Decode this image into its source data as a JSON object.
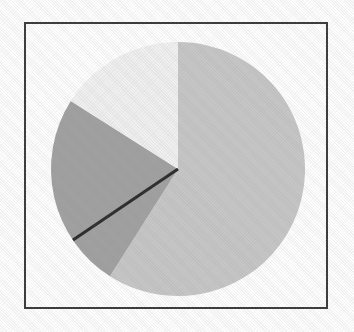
{
  "figure": {
    "background_color": "#ffffff",
    "frame_color": "#3a3a3a",
    "frame_width_px": 2,
    "width_px": 354,
    "height_px": 332
  },
  "chart_data": {
    "type": "pie",
    "title": "",
    "subtitle": "",
    "xlabel": "",
    "ylabel": "",
    "legend": false,
    "legend_position": "none",
    "grid": false,
    "labels_shown": false,
    "start_angle_deg": -90,
    "direction": "clockwise",
    "center_px": [
      178,
      169
    ],
    "radius_px": 127,
    "categories": [
      "Slice 1",
      "Slice 2",
      "Slice 3"
    ],
    "values": [
      59,
      25,
      16
    ],
    "percentages": [
      59,
      25,
      16
    ],
    "angles_deg": [
      212.4,
      90.0,
      57.6
    ],
    "colors": [
      "#c7c7c7",
      "#a1a1a1",
      "#f1f1f1"
    ],
    "slices": [
      {
        "name": "Slice 1",
        "value": 59,
        "percent": 16,
        "color": "#c7c7c7",
        "start_deg": -90,
        "end_deg": 122.4,
        "edge_color": "none",
        "exploded": false
      },
      {
        "name": "Slice 2",
        "value": 25,
        "percent": 25,
        "color": "#a1a1a1",
        "start_deg": 122.4,
        "end_deg": 212.4,
        "edge_color": "#2b2b2b",
        "exploded": false
      },
      {
        "name": "Slice 3",
        "value": 16,
        "percent": 59,
        "color": "#f1f1f1",
        "start_deg": 212.4,
        "end_deg": 270,
        "edge_color": "none",
        "exploded": false
      }
    ],
    "divider_line": {
      "name": "dark-radius-edge",
      "color": "#2b2b2b",
      "width_px": 3,
      "from_px": [
        178,
        169
      ],
      "to_px": [
        73,
        240
      ]
    }
  }
}
